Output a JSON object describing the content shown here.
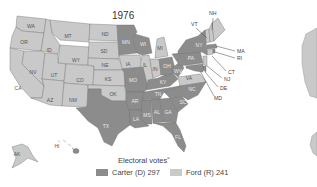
{
  "map": {
    "title": "1976",
    "colors": {
      "carter": "#8c8c8c",
      "ford": "#c9c9c9",
      "border": "#6e6e6e"
    },
    "states": [
      {
        "abbr": "WA",
        "winner": "ford"
      },
      {
        "abbr": "OR",
        "winner": "ford"
      },
      {
        "abbr": "CA",
        "winner": "ford"
      },
      {
        "abbr": "ID",
        "winner": "ford"
      },
      {
        "abbr": "NV",
        "winner": "ford"
      },
      {
        "abbr": "MT",
        "winner": "ford"
      },
      {
        "abbr": "WY",
        "winner": "ford"
      },
      {
        "abbr": "UT",
        "winner": "ford"
      },
      {
        "abbr": "AZ",
        "winner": "ford"
      },
      {
        "abbr": "CO",
        "winner": "ford"
      },
      {
        "abbr": "NM",
        "winner": "ford"
      },
      {
        "abbr": "ND",
        "winner": "ford"
      },
      {
        "abbr": "SD",
        "winner": "ford"
      },
      {
        "abbr": "NE",
        "winner": "ford"
      },
      {
        "abbr": "KS",
        "winner": "ford"
      },
      {
        "abbr": "OK",
        "winner": "ford"
      },
      {
        "abbr": "TX",
        "winner": "carter"
      },
      {
        "abbr": "MN",
        "winner": "carter"
      },
      {
        "abbr": "IA",
        "winner": "ford"
      },
      {
        "abbr": "MO",
        "winner": "carter"
      },
      {
        "abbr": "AR",
        "winner": "carter"
      },
      {
        "abbr": "LA",
        "winner": "carter"
      },
      {
        "abbr": "WI",
        "winner": "carter"
      },
      {
        "abbr": "IL",
        "winner": "ford"
      },
      {
        "abbr": "MI",
        "winner": "ford"
      },
      {
        "abbr": "IN",
        "winner": "ford"
      },
      {
        "abbr": "OH",
        "winner": "carter"
      },
      {
        "abbr": "KY",
        "winner": "carter"
      },
      {
        "abbr": "TN",
        "winner": "carter"
      },
      {
        "abbr": "MS",
        "winner": "carter"
      },
      {
        "abbr": "AL",
        "winner": "carter"
      },
      {
        "abbr": "GA",
        "winner": "carter"
      },
      {
        "abbr": "FL",
        "winner": "carter"
      },
      {
        "abbr": "SC",
        "winner": "carter"
      },
      {
        "abbr": "NC",
        "winner": "carter"
      },
      {
        "abbr": "VA",
        "winner": "ford"
      },
      {
        "abbr": "WV",
        "winner": "carter"
      },
      {
        "abbr": "PA",
        "winner": "carter"
      },
      {
        "abbr": "NY",
        "winner": "carter"
      },
      {
        "abbr": "VT",
        "winner": "ford"
      },
      {
        "abbr": "NH",
        "winner": "ford"
      },
      {
        "abbr": "ME",
        "winner": "ford"
      },
      {
        "abbr": "MA",
        "winner": "carter"
      },
      {
        "abbr": "RI",
        "winner": "carter"
      },
      {
        "abbr": "CT",
        "winner": "ford"
      },
      {
        "abbr": "NJ",
        "winner": "ford"
      },
      {
        "abbr": "DE",
        "winner": "carter"
      },
      {
        "abbr": "MD",
        "winner": "carter"
      },
      {
        "abbr": "AK",
        "winner": "ford"
      },
      {
        "abbr": "HI",
        "winner": "carter"
      }
    ]
  },
  "legend": {
    "title": "Electoral votes",
    "footnote_mark": "a",
    "carter_label": "Carter (D) 297",
    "ford_label": "Ford (R) 241"
  }
}
